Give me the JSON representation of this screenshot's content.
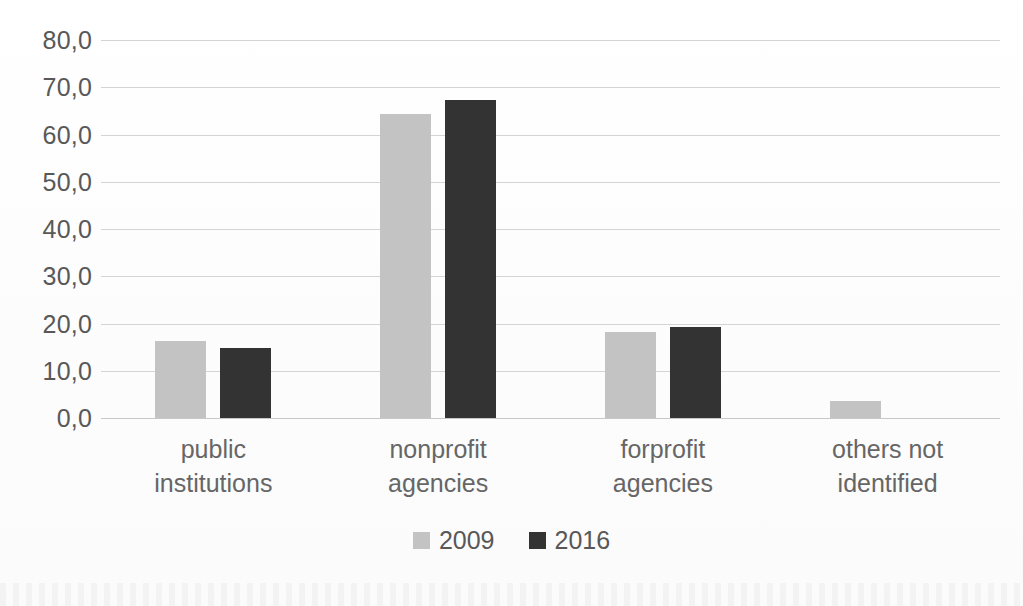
{
  "chart_data": {
    "type": "bar",
    "title": "",
    "subtitle": "",
    "xlabel": "",
    "ylabel": "",
    "categories": [
      "public\ninstitutions",
      "nonprofit\nagencies",
      "forprofit\nagencies",
      "others not\nidentified"
    ],
    "series": [
      {
        "name": "2009",
        "color": "#c3c3c3",
        "values": [
          16.2,
          64.4,
          18.1,
          3.6
        ]
      },
      {
        "name": "2016",
        "color": "#333333",
        "values": [
          14.9,
          67.4,
          19.2,
          null
        ]
      }
    ],
    "ylim": [
      0,
      80
    ],
    "y_tick_values": [
      80,
      70,
      60,
      50,
      40,
      30,
      20,
      10,
      0
    ],
    "y_tick_labels": [
      "80,0",
      "70,0",
      "60,0",
      "50,0",
      "40,0",
      "30,0",
      "20,0",
      "10,0",
      "0,0"
    ],
    "grid": true,
    "grid_axis": "y",
    "legend_position": "bottom",
    "decimal_separator": ","
  },
  "legend": {
    "items": [
      {
        "label": "2009",
        "swatch": "legend-swatch-2009"
      },
      {
        "label": "2016",
        "swatch": "legend-swatch-2016"
      }
    ]
  },
  "colors": {
    "series_2009": "#c3c3c3",
    "series_2016": "#333333",
    "gridline": "#d4d4d4",
    "axis_text": "#585858",
    "category_text": "#666666",
    "background": "#ffffff"
  }
}
